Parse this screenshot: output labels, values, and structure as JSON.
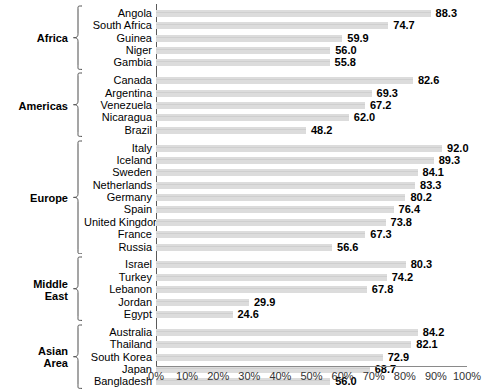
{
  "chart_data": {
    "type": "bar",
    "orientation": "horizontal",
    "title": "",
    "xlabel": "",
    "ylabel": "",
    "xlim": [
      0,
      100
    ],
    "xticks": [
      "0%",
      "10%",
      "20%",
      "30%",
      "40%",
      "50%",
      "60%",
      "70%",
      "80%",
      "90%",
      "100%"
    ],
    "grid": false,
    "legend": null,
    "bar_color": "#dcdcdc",
    "value_label_format": "one-decimal",
    "groups": [
      {
        "name": "Africa",
        "name_lines": [
          "Africa"
        ],
        "categories": [
          "Angola",
          "South Africa",
          "Guinea",
          "Niger",
          "Gambia"
        ],
        "values": [
          88.3,
          74.7,
          59.9,
          56.0,
          55.8
        ]
      },
      {
        "name": "Americas",
        "name_lines": [
          "Americas"
        ],
        "categories": [
          "Canada",
          "Argentina",
          "Venezuela",
          "Nicaragua",
          "Brazil"
        ],
        "values": [
          82.6,
          69.3,
          67.2,
          62.0,
          48.2
        ]
      },
      {
        "name": "Europe",
        "name_lines": [
          "Europe"
        ],
        "categories": [
          "Italy",
          "Iceland",
          "Sweden",
          "Netherlands",
          "Germany",
          "Spain",
          "United Kingdom",
          "France",
          "Russia"
        ],
        "values": [
          92.0,
          89.3,
          84.1,
          83.3,
          80.2,
          76.4,
          73.8,
          67.3,
          56.6
        ]
      },
      {
        "name": "Middle East",
        "name_lines": [
          "Middle",
          "East"
        ],
        "categories": [
          "Israel",
          "Turkey",
          "Lebanon",
          "Jordan",
          "Egypt"
        ],
        "values": [
          80.3,
          74.2,
          67.8,
          29.9,
          24.6
        ]
      },
      {
        "name": "Asian Area",
        "name_lines": [
          "Asian",
          "Area"
        ],
        "categories": [
          "Australia",
          "Thailand",
          "South Korea",
          "Japan",
          "Bangladesh"
        ],
        "values": [
          84.2,
          82.1,
          72.9,
          68.7,
          56.0
        ]
      }
    ]
  }
}
